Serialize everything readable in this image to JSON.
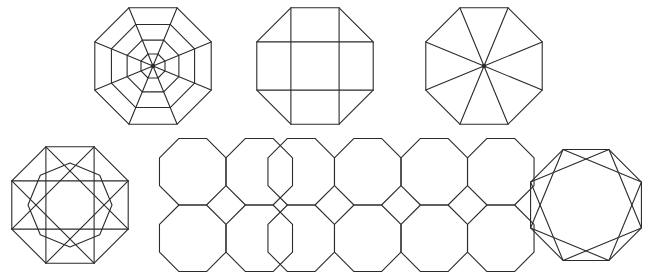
{
  "sheet": {
    "title": "Octagonal dissection and tiling figures",
    "width": 654,
    "height": 275,
    "background_color": "#ffffff",
    "stroke_color": "#2b2b2b",
    "stroke_width": 1.1,
    "fill": "none",
    "figure_count": 7,
    "rows": 2,
    "layout_note": "Row 1: three octagon figures. Row 2: four octagon figures."
  },
  "figures": [
    {
      "id": "fig-1",
      "index": 1,
      "name": "concentric-octagon-web",
      "label": "Concentric octagons with radial spokes",
      "row": 1,
      "column": 1,
      "center": {
        "x": 153,
        "y": 66
      },
      "outer_radius": 63,
      "rotation_deg": 22.5,
      "rings": 4,
      "ring_radii": [
        63,
        45,
        28,
        13
      ],
      "spokes": 8,
      "has_center_dot": true
    },
    {
      "id": "fig-2",
      "index": 2,
      "name": "octagon-with-cross-grid",
      "label": "Octagon with tic-tac-toe grid",
      "row": 1,
      "column": 2,
      "center": {
        "x": 315,
        "y": 66
      },
      "outer_radius": 63,
      "rotation_deg": 22.5,
      "grid_lines": {
        "horizontal": 2,
        "vertical": 2
      },
      "grid_note": "Chords joining opposite octagon vertices form a 3x3 grid"
    },
    {
      "id": "fig-3",
      "index": 3,
      "name": "octagon-eight-triangles",
      "label": "Octagon divided into eight triangles",
      "row": 1,
      "column": 3,
      "center": {
        "x": 484,
        "y": 66
      },
      "outer_radius": 63,
      "rotation_deg": 22.5,
      "triangles": 8,
      "has_center_dot": true
    },
    {
      "id": "fig-4",
      "index": 4,
      "name": "octagram-star-octagon",
      "label": "Octagon with {8/3} star polygon and inner octagon",
      "row": 2,
      "column": 1,
      "center": {
        "x": 70,
        "y": 205
      },
      "outer_radius": 63,
      "rotation_deg": 22.5,
      "star_step": 3,
      "inner_octagon": true,
      "inner_radius": 42
    },
    {
      "id": "fig-5",
      "index": 5,
      "name": "four-octagons-square-gap",
      "label": "Four octagons in 2x2 with central square gap",
      "row": 2,
      "column": 2,
      "center": {
        "x": 226,
        "y": 205
      },
      "octagon_radius": 36,
      "rotation_deg": 22.5,
      "grid": {
        "rows": 2,
        "columns": 2
      },
      "center_gap_shape": "square"
    },
    {
      "id": "fig-6",
      "index": 6,
      "name": "octagon-tessellation-2x4",
      "label": "Overlapping octagon tessellation, two rows of four",
      "row": 2,
      "column": 3,
      "center": {
        "x": 401,
        "y": 205
      },
      "octagon_radius": 36,
      "rotation_deg": 22.5,
      "grid": {
        "rows": 2,
        "columns": 4
      },
      "overlap": true
    },
    {
      "id": "fig-7",
      "index": 7,
      "name": "octagon-two-squares-star",
      "label": "Octagon with two overlapping inscribed squares",
      "row": 2,
      "column": 4,
      "center": {
        "x": 586,
        "y": 205
      },
      "outer_radius": 60,
      "rotation_deg": 22.5,
      "inscribed_squares": 2,
      "square_rotation_offset_deg": 45
    }
  ]
}
